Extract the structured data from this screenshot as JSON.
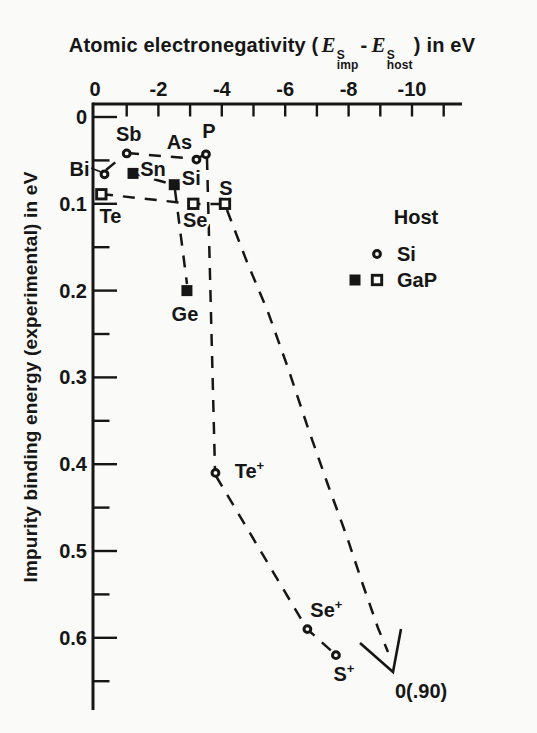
{
  "figure": {
    "background": "#fafaf8",
    "ink": "#161616",
    "width": 537,
    "height": 733
  },
  "title": {
    "prefix": "Atomic electronegativity (",
    "E1": "E",
    "sup1": "S",
    "sub1": "imp",
    "minus": "-",
    "E2": "E",
    "sup2": "S",
    "sub2": "host",
    "suffix": ") in eV"
  },
  "y_axis_label": "Impurity binding energy (experimental) in eV",
  "legend": {
    "title": "Host",
    "entries": [
      {
        "label": "Si",
        "marker": "open-circle"
      },
      {
        "label": "GaP",
        "markers": [
          "filled-square",
          "open-square"
        ]
      }
    ]
  },
  "chart_data": {
    "type": "scatter",
    "xlabel": "Atomic electronegativity (E_imp^S - E_host^S) in eV",
    "ylabel": "Impurity binding energy (experimental) in eV",
    "x_axis": {
      "position": "top",
      "tick_labels": [
        0,
        -2,
        -4,
        -6,
        -8,
        -10
      ],
      "minor_tick_step": 1,
      "range": [
        0,
        -11.6
      ],
      "note": "negative values increase to the right"
    },
    "y_axis": {
      "position": "left",
      "tick_labels": [
        0,
        0.1,
        0.2,
        0.3,
        0.4,
        0.5,
        0.6
      ],
      "minor_tick_step": 0.05,
      "range": [
        0,
        0.68
      ],
      "note": "values increase downward"
    },
    "series": [
      {
        "host": "Si",
        "marker": "open-circle",
        "points": [
          {
            "label": "Bi",
            "x": -0.3,
            "y": 0.066,
            "label_offset": [
              -25,
              -5
            ]
          },
          {
            "label": "Sb",
            "x": -1.0,
            "y": 0.042,
            "label_offset": [
              2,
              -19
            ]
          },
          {
            "label": "As",
            "x": -3.2,
            "y": 0.049,
            "label_offset": [
              -17,
              -18
            ]
          },
          {
            "label": "P",
            "x": -3.5,
            "y": 0.043,
            "label_offset": [
              3,
              -23
            ]
          },
          {
            "label": "Te+",
            "x": -3.8,
            "y": 0.41,
            "label_offset": [
              34,
              -2
            ]
          },
          {
            "label": "Se+",
            "x": -6.7,
            "y": 0.59,
            "label_offset": [
              19,
              -19
            ]
          },
          {
            "label": "S+",
            "x": -7.6,
            "y": 0.62,
            "label_offset": [
              8,
              19
            ]
          }
        ]
      },
      {
        "host": "GaP",
        "marker": "filled-square",
        "points": [
          {
            "label": "Sn",
            "x": -1.2,
            "y": 0.065,
            "label_offset": [
              20,
              -4
            ]
          },
          {
            "label": "Si",
            "x": -2.5,
            "y": 0.078,
            "label_offset": [
              17,
              -7
            ]
          },
          {
            "label": "Ge",
            "x": -2.9,
            "y": 0.2,
            "label_offset": [
              -2,
              23
            ]
          }
        ]
      },
      {
        "host": "GaP",
        "marker": "open-square",
        "points": [
          {
            "label": "Te",
            "x": -0.2,
            "y": 0.089,
            "label_offset": [
              9,
              22
            ]
          },
          {
            "label": "Se",
            "x": -3.1,
            "y": 0.1,
            "label_offset": [
              2,
              16
            ]
          },
          {
            "label": "S",
            "x": -4.1,
            "y": 0.1,
            "label_offset": [
              1,
              -16
            ]
          }
        ]
      }
    ],
    "connections_px": {
      "dashed": [
        [
          [
            106,
            170
          ],
          [
            123,
            156
          ]
        ],
        [
          [
            127,
            153
          ],
          [
            196,
            159
          ],
          [
            206,
            154
          ]
        ],
        [
          [
            207,
            158
          ],
          [
            215,
            470
          ]
        ],
        [
          [
            216,
            476
          ],
          [
            307,
            629
          ],
          [
            336,
            655
          ]
        ],
        [
          [
            101,
            194
          ],
          [
            193,
            204
          ],
          [
            225,
            204
          ]
        ],
        [
          [
            227,
            210
          ],
          [
            247,
            262
          ],
          [
            268,
            312
          ],
          [
            288,
            368
          ],
          [
            308,
            428
          ],
          [
            328,
            485
          ],
          [
            347,
            537
          ],
          [
            363,
            585
          ],
          [
            378,
            628
          ],
          [
            388,
            652
          ]
        ],
        [
          [
            133,
            173
          ],
          [
            174,
            185
          ]
        ],
        [
          [
            175,
            190
          ],
          [
            187,
            284
          ]
        ]
      ],
      "arrow": [
        [
          360,
          643
        ],
        [
          393,
          672
        ],
        [
          401,
          629
        ]
      ],
      "bi_leader": [
        [
          91,
          168
        ],
        [
          101,
          172
        ]
      ]
    },
    "annotations": [
      {
        "text": "0(.90)",
        "px": [
          395,
          698
        ],
        "meaning": "oxygen level 0.90 eV, off scale, pointed to by arrow"
      }
    ],
    "legend": {
      "title": "Host",
      "position": "middle-right",
      "entries": [
        {
          "marker": "open-circle",
          "label": "Si"
        },
        {
          "marker": "filled-square + open-square",
          "label": "GaP"
        }
      ]
    }
  }
}
